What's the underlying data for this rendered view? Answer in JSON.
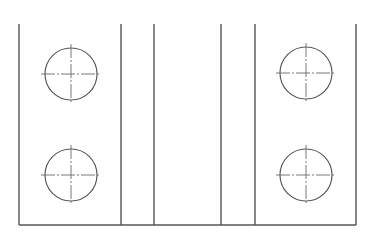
{
  "drawing": {
    "title": "Plate with four holes — top view",
    "colors": {
      "background": "#ffffff",
      "line": "#555555"
    },
    "outline": {
      "x1": 19,
      "y1": 24,
      "x2": 356,
      "y2": 225
    },
    "vertical_lines_x": [
      121,
      154,
      221,
      255
    ],
    "holes": [
      {
        "id": "top-left",
        "cx": 71,
        "cy": 74,
        "r": 26
      },
      {
        "id": "bottom-left",
        "cx": 71,
        "cy": 175,
        "r": 26
      },
      {
        "id": "top-right",
        "cx": 306,
        "cy": 73,
        "r": 26
      },
      {
        "id": "bottom-right",
        "cx": 306,
        "cy": 175,
        "r": 26
      }
    ],
    "centerline_overhang": 4
  }
}
